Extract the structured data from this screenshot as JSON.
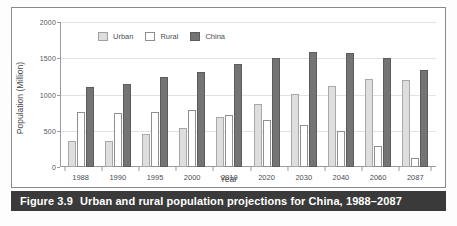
{
  "caption": {
    "number": "Figure 3.9",
    "text": "Urban and rural population projections for China, 1988–2087"
  },
  "legend": {
    "position": "top-center",
    "items": [
      {
        "label": "Urban",
        "color": "#dedede"
      },
      {
        "label": "Rural",
        "color": "#ffffff"
      },
      {
        "label": "China",
        "color": "#747474"
      }
    ]
  },
  "axes": {
    "ylabel": "Population (Million)",
    "xlabel": "Year",
    "yticks": [
      "0",
      "500",
      "1000",
      "1500",
      "2000"
    ]
  },
  "chart_data": {
    "type": "bar",
    "title": "Urban and rural population projections for China, 1988–2087",
    "xlabel": "Year",
    "ylabel": "Population (Million)",
    "ylim": [
      0,
      2000
    ],
    "yticks": [
      0,
      500,
      1000,
      1500,
      2000
    ],
    "grid": true,
    "legend": "top-center",
    "categories": [
      "1988",
      "1990",
      "1995",
      "2000",
      "2010",
      "2020",
      "2030",
      "2040",
      "2060",
      "2087"
    ],
    "series": [
      {
        "name": "Urban",
        "color": "#dedede",
        "values": [
          355,
          355,
          450,
          535,
          685,
          865,
          1005,
          1120,
          1220,
          1200
        ]
      },
      {
        "name": "Rural",
        "color": "#ffffff",
        "values": [
          765,
          750,
          765,
          790,
          720,
          645,
          575,
          490,
          295,
          130
        ]
      },
      {
        "name": "China",
        "color": "#747474",
        "values": [
          1105,
          1145,
          1240,
          1305,
          1420,
          1510,
          1580,
          1575,
          1500,
          1335
        ]
      }
    ]
  }
}
